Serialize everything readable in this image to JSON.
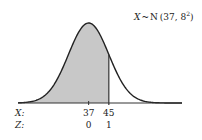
{
  "chart_data": {
    "type": "area",
    "distribution": "normal",
    "mean": 37,
    "sd": 8,
    "shaded_region": {
      "from": "-inf",
      "to": 45,
      "side": "left"
    },
    "marker_line_x": 45,
    "x_ticks": [
      37,
      45
    ],
    "x_tick_labels": [
      "37",
      "45"
    ],
    "z_tick_labels": [
      "0",
      "1"
    ],
    "row_labels": {
      "x": "X:",
      "z": "Z:"
    },
    "annotation": {
      "var": "X",
      "tilde": "~",
      "dist": "N",
      "params": "(37, 8",
      "exp": "2",
      "close": ")"
    },
    "xlim": [
      9,
      74
    ],
    "grid": false,
    "colors": {
      "shade": "#c8c8c8",
      "curve": "#222222"
    }
  }
}
